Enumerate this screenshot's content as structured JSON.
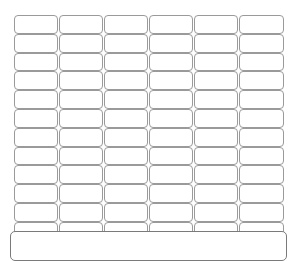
{
  "grid": {
    "rows": 12,
    "columns": 6,
    "cells": [
      [
        "",
        "",
        "",
        "",
        "",
        ""
      ],
      [
        "",
        "",
        "",
        "",
        "",
        ""
      ],
      [
        "",
        "",
        "",
        "",
        "",
        ""
      ],
      [
        "",
        "",
        "",
        "",
        "",
        ""
      ],
      [
        "",
        "",
        "",
        "",
        "",
        ""
      ],
      [
        "",
        "",
        "",
        "",
        "",
        ""
      ],
      [
        "",
        "",
        "",
        "",
        "",
        ""
      ],
      [
        "",
        "",
        "",
        "",
        "",
        ""
      ],
      [
        "",
        "",
        "",
        "",
        "",
        ""
      ],
      [
        "",
        "",
        "",
        "",
        "",
        ""
      ],
      [
        "",
        "",
        "",
        "",
        "",
        ""
      ],
      [
        "",
        "",
        "",
        "",
        "",
        ""
      ]
    ]
  },
  "panel": {
    "text": ""
  }
}
